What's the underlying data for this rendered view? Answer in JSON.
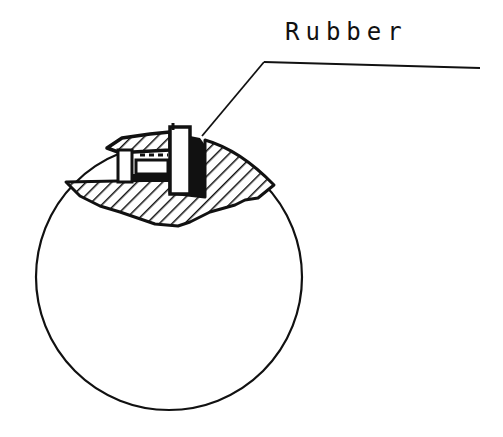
{
  "diagram": {
    "callout_label": "Rubber",
    "colors": {
      "ink": "#111111",
      "background": "#ffffff"
    },
    "parts": [
      {
        "name": "circle-detail-view",
        "description": "circular detail boundary"
      },
      {
        "name": "hatched-body",
        "description": "cross-hatched sectioned body"
      },
      {
        "name": "cap",
        "description": "hatched cap with legs"
      },
      {
        "name": "pillar",
        "description": "white vertical post"
      },
      {
        "name": "rubber-strip",
        "description": "black filled rubber seal"
      },
      {
        "name": "leader-line",
        "description": "callout leader to Rubber label"
      }
    ]
  }
}
